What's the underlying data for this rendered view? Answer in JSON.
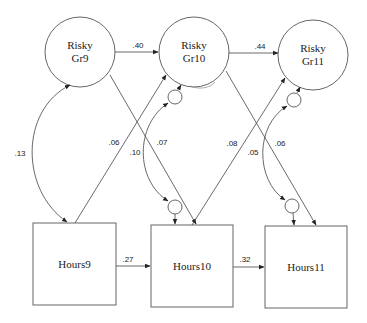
{
  "diagram": {
    "type": "path-model",
    "nodes": [
      {
        "id": "gr9",
        "shape": "circle",
        "label_line1": "Risky",
        "label_line2": "Gr9",
        "cx": 80,
        "cy": 52,
        "r": 35
      },
      {
        "id": "gr10",
        "shape": "circle",
        "label_line1": "Risky",
        "label_line2": "Gr10",
        "cx": 194,
        "cy": 52,
        "r": 35
      },
      {
        "id": "gr11",
        "shape": "circle",
        "label_line1": "Risky",
        "label_line2": "Gr11",
        "cx": 313,
        "cy": 55,
        "r": 35
      },
      {
        "id": "hours9",
        "shape": "box",
        "label": "Hours9",
        "x": 33,
        "y": 223,
        "w": 83,
        "h": 82
      },
      {
        "id": "hours10",
        "shape": "box",
        "label": "Hours10",
        "x": 151,
        "y": 225,
        "w": 82,
        "h": 82
      },
      {
        "id": "hours11",
        "shape": "box",
        "label": "Hours11",
        "x": 265,
        "y": 226,
        "w": 82,
        "h": 82
      }
    ],
    "error_terms": [
      {
        "id": "e_gr10",
        "cx": 175,
        "cy": 97,
        "r": 7
      },
      {
        "id": "e_gr11",
        "cx": 294,
        "cy": 100,
        "r": 7
      },
      {
        "id": "e_hours10",
        "cx": 175,
        "cy": 207,
        "r": 7
      },
      {
        "id": "e_hours11",
        "cx": 292,
        "cy": 206,
        "r": 7
      }
    ],
    "paths": [
      {
        "from": "Risky Gr9",
        "to": "Risky Gr10",
        "coef": ".40"
      },
      {
        "from": "Risky Gr10",
        "to": "Risky Gr11",
        "coef": ".44"
      },
      {
        "from": "Hours9",
        "to": "Hours10",
        "coef": ".27"
      },
      {
        "from": "Hours10",
        "to": "Hours11",
        "coef": ".32"
      },
      {
        "from": "Hours9",
        "to": "Risky Gr10",
        "coef": ".06"
      },
      {
        "from": "Risky Gr9",
        "to": "Hours10",
        "coef": ".07"
      },
      {
        "from": "Hours10",
        "to": "Risky Gr11",
        "coef": ".08"
      },
      {
        "from": "Risky Gr10",
        "to": "Hours11",
        "coef": ".06"
      }
    ],
    "covariances": [
      {
        "between": [
          "Risky Gr9",
          "Hours9"
        ],
        "coef": ".13"
      },
      {
        "between": [
          "e Gr10",
          "e Hours10"
        ],
        "coef": ".10"
      },
      {
        "between": [
          "e Gr11",
          "e Hours11"
        ],
        "coef": ".05"
      }
    ],
    "labels": {
      "p40": ".40",
      "p44": ".44",
      "p27": ".27",
      "p32": ".32",
      "p06a": ".06",
      "p07": ".07",
      "p08": ".08",
      "p06b": ".06",
      "c13": ".13",
      "c10": ".10",
      "c05": ".05"
    }
  }
}
